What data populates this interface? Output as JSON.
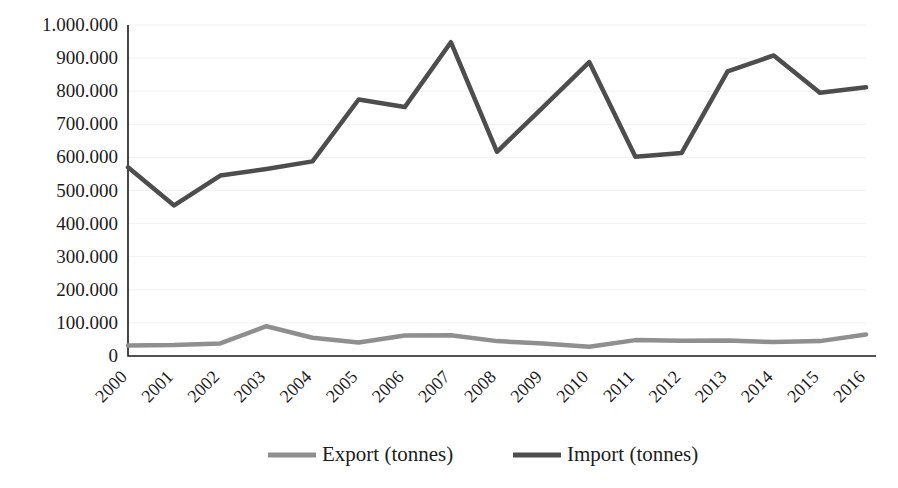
{
  "chart_data": {
    "type": "line",
    "title": "",
    "subtitle": "",
    "xlabel": "",
    "ylabel": "",
    "grid": false,
    "legend_position": "bottom",
    "categories": [
      "2000",
      "2001",
      "2002",
      "2003",
      "2004",
      "2005",
      "2006",
      "2007",
      "2008",
      "2009",
      "2010",
      "2011",
      "2012",
      "2013",
      "2014",
      "2015",
      "2016"
    ],
    "ylim": [
      0,
      1000000
    ],
    "ytick_values": [
      0,
      100000,
      200000,
      300000,
      400000,
      500000,
      600000,
      700000,
      800000,
      900000,
      1000000
    ],
    "ytick_labels": [
      "0",
      "100.000",
      "200.000",
      "300.000",
      "400.000",
      "500.000",
      "600.000",
      "700.000",
      "800.000",
      "900.000",
      "1.000.000"
    ],
    "series": [
      {
        "name": "Export (tonnes)",
        "color": "#8f8f8f",
        "values": [
          32000,
          33000,
          38000,
          90000,
          55000,
          41000,
          62000,
          63000,
          45000,
          38000,
          28000,
          48000,
          46000,
          47000,
          42000,
          45000,
          65000
        ]
      },
      {
        "name": "Import (tonnes)",
        "color": "#4d4d4d",
        "values": [
          570000,
          455000,
          545000,
          565000,
          588000,
          775000,
          752000,
          948000,
          617000,
          752000,
          888000,
          602000,
          613000,
          860000,
          908000,
          795000,
          812000
        ]
      }
    ]
  },
  "legend": {
    "items": [
      {
        "label": "Export (tonnes)",
        "color": "#8f8f8f"
      },
      {
        "label": "Import (tonnes)",
        "color": "#4d4d4d"
      }
    ]
  },
  "axes": {
    "y_axis_name": "value-axis",
    "x_axis_name": "year-axis"
  }
}
